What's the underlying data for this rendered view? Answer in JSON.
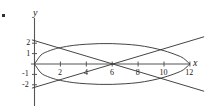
{
  "figure": {
    "bullet_marker": "•",
    "background": "#ffffff",
    "ink_color": "#303030",
    "axis_color": "#4a4a4a"
  },
  "axes": {
    "x_name": "x",
    "y_name": "y",
    "x_ticks": [
      {
        "value": 2,
        "label": "2"
      },
      {
        "value": 4,
        "label": "4"
      },
      {
        "value": 6,
        "label": "6"
      },
      {
        "value": 8,
        "label": "8"
      },
      {
        "value": 10,
        "label": "10"
      },
      {
        "value": 12,
        "label": "12"
      }
    ],
    "y_ticks": [
      {
        "value": 2,
        "label": "2"
      },
      {
        "value": 1,
        "label": "1"
      },
      {
        "value": -1,
        "label": "-1"
      },
      {
        "value": -2,
        "label": "-2"
      }
    ]
  },
  "chart_data": {
    "type": "line",
    "title": "",
    "xlabel": "x",
    "ylabel": "y",
    "xlim": [
      -0.6,
      13.2
    ],
    "ylim": [
      -2.9,
      2.9
    ],
    "grid": false,
    "legend": "none",
    "series": [
      {
        "name": "closed-loop-upper",
        "comment": "upper branch of closed loop from (0,0) to (12,0), peak near y=2 around x=5",
        "x": [
          0,
          0.5,
          1,
          1.5,
          2,
          3,
          4,
          5,
          6,
          7,
          8,
          9,
          10,
          11,
          11.5,
          12
        ],
        "y": [
          0,
          0.86,
          1.2,
          1.42,
          1.58,
          1.79,
          1.9,
          1.96,
          1.96,
          1.9,
          1.79,
          1.58,
          1.28,
          0.85,
          0.55,
          0
        ]
      },
      {
        "name": "closed-loop-lower",
        "comment": "lower branch of closed loop, mirror of upper",
        "x": [
          0,
          0.5,
          1,
          1.5,
          2,
          3,
          4,
          5,
          6,
          7,
          8,
          9,
          10,
          11,
          11.5,
          12
        ],
        "y": [
          0,
          -0.86,
          -1.2,
          -1.42,
          -1.58,
          -1.79,
          -1.9,
          -1.96,
          -1.96,
          -1.9,
          -1.79,
          -1.58,
          -1.28,
          -0.85,
          -0.55,
          0
        ]
      },
      {
        "name": "rising-line",
        "comment": "straight line rising left-to-right, through (4,-2)... crosses axis region",
        "x": [
          -0.2,
          13.1
        ],
        "y": [
          -2.32,
          2.62
        ]
      },
      {
        "name": "falling-line",
        "comment": "straight line falling left-to-right, mirror of rising line",
        "x": [
          -0.2,
          13.1
        ],
        "y": [
          2.32,
          -2.62
        ]
      }
    ],
    "intersections": [
      {
        "x": 4.0,
        "y": 2.0
      },
      {
        "x": 4.0,
        "y": -2.0
      }
    ]
  }
}
